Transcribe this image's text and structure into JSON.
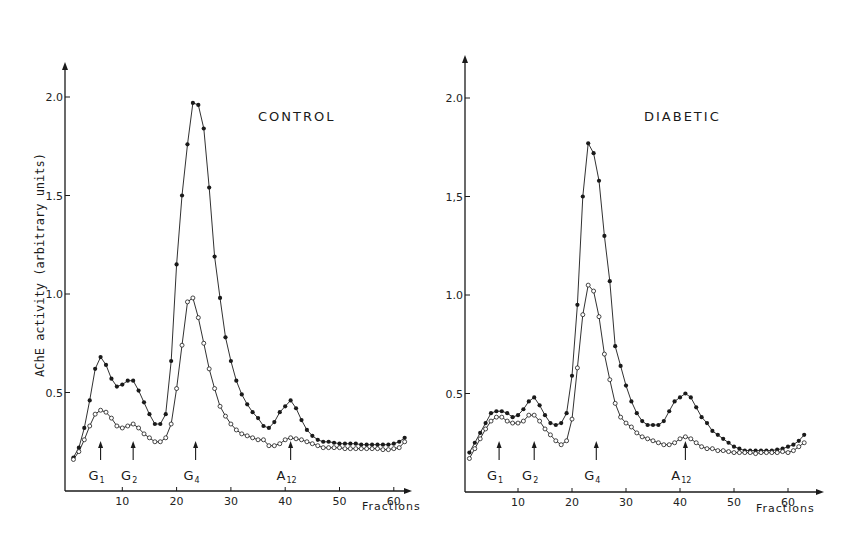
{
  "chart_data": [
    {
      "type": "line",
      "title": "CONTROL",
      "xlabel": "Fractions",
      "ylabel": "AChE activity (arbitrary units)",
      "xlim": [
        0,
        63
      ],
      "ylim": [
        0,
        2.3
      ],
      "x_ticks": [
        10,
        20,
        30,
        40,
        50,
        60
      ],
      "y_ticks": [
        {
          "value": 0.5,
          "label": "0.5"
        },
        {
          "value": 1.0,
          "label": "1.0"
        },
        {
          "value": 1.5,
          "label": "1.5"
        },
        {
          "value": 2.0,
          "label": "2.0"
        }
      ],
      "grid": false,
      "markers": [
        {
          "label": "G",
          "sub": "1",
          "x": 6
        },
        {
          "label": "G",
          "sub": "2",
          "x": 12
        },
        {
          "label": "G",
          "sub": "4",
          "x": 23.5
        },
        {
          "label": "A",
          "sub": "12",
          "x": 41
        }
      ],
      "series": [
        {
          "name": "filled-circles",
          "marker": "filled",
          "x": [
            1,
            2,
            3,
            4,
            5,
            6,
            7,
            8,
            9,
            10,
            11,
            12,
            13,
            14,
            15,
            16,
            17,
            18,
            19,
            20,
            21,
            22,
            23,
            24,
            25,
            26,
            27,
            28,
            29,
            30,
            31,
            32,
            33,
            34,
            35,
            36,
            37,
            38,
            39,
            40,
            41,
            42,
            43,
            44,
            45,
            46,
            47,
            48,
            49,
            50,
            51,
            52,
            53,
            54,
            55,
            56,
            57,
            58,
            59,
            60,
            61,
            62
          ],
          "values": [
            0.17,
            0.22,
            0.32,
            0.46,
            0.62,
            0.68,
            0.64,
            0.57,
            0.53,
            0.54,
            0.56,
            0.56,
            0.51,
            0.45,
            0.39,
            0.34,
            0.34,
            0.39,
            0.66,
            1.15,
            1.5,
            1.76,
            1.97,
            1.96,
            1.84,
            1.54,
            1.19,
            0.98,
            0.78,
            0.66,
            0.56,
            0.49,
            0.44,
            0.4,
            0.37,
            0.33,
            0.32,
            0.35,
            0.4,
            0.43,
            0.46,
            0.42,
            0.36,
            0.31,
            0.28,
            0.26,
            0.25,
            0.25,
            0.245,
            0.24,
            0.24,
            0.24,
            0.24,
            0.235,
            0.235,
            0.235,
            0.235,
            0.235,
            0.235,
            0.24,
            0.25,
            0.27
          ]
        },
        {
          "name": "open-circles",
          "marker": "open",
          "x": [
            1,
            2,
            3,
            4,
            5,
            6,
            7,
            8,
            9,
            10,
            11,
            12,
            13,
            14,
            15,
            16,
            17,
            18,
            19,
            20,
            21,
            22,
            23,
            24,
            25,
            26,
            27,
            28,
            29,
            30,
            31,
            32,
            33,
            34,
            35,
            36,
            37,
            38,
            39,
            40,
            41,
            42,
            43,
            44,
            45,
            46,
            47,
            48,
            49,
            50,
            51,
            52,
            53,
            54,
            55,
            56,
            57,
            58,
            59,
            60,
            61,
            62
          ],
          "values": [
            0.16,
            0.2,
            0.26,
            0.33,
            0.39,
            0.41,
            0.4,
            0.37,
            0.33,
            0.32,
            0.33,
            0.34,
            0.32,
            0.29,
            0.27,
            0.25,
            0.25,
            0.27,
            0.34,
            0.52,
            0.74,
            0.96,
            0.98,
            0.88,
            0.75,
            0.62,
            0.52,
            0.43,
            0.38,
            0.34,
            0.31,
            0.29,
            0.28,
            0.27,
            0.26,
            0.26,
            0.23,
            0.23,
            0.24,
            0.26,
            0.27,
            0.265,
            0.26,
            0.25,
            0.24,
            0.23,
            0.22,
            0.22,
            0.22,
            0.22,
            0.215,
            0.215,
            0.215,
            0.215,
            0.215,
            0.215,
            0.215,
            0.21,
            0.21,
            0.215,
            0.22,
            0.25
          ]
        }
      ]
    },
    {
      "type": "line",
      "title": "DIABETIC",
      "xlabel": "Fractions",
      "ylabel": "",
      "xlim": [
        0,
        64
      ],
      "ylim": [
        0,
        2.3
      ],
      "x_ticks": [
        10,
        20,
        30,
        40,
        50,
        60
      ],
      "y_ticks": [
        {
          "value": 0.5,
          "label": "0.5"
        },
        {
          "value": 1.0,
          "label": "1.0"
        },
        {
          "value": 1.5,
          "label": "1,5"
        },
        {
          "value": 2.0,
          "label": "2.0"
        }
      ],
      "grid": false,
      "markers": [
        {
          "label": "G",
          "sub": "1",
          "x": 6.5
        },
        {
          "label": "G",
          "sub": "2",
          "x": 13
        },
        {
          "label": "G",
          "sub": "4",
          "x": 24.5
        },
        {
          "label": "A",
          "sub": "12",
          "x": 41
        }
      ],
      "series": [
        {
          "name": "filled-circles",
          "marker": "filled",
          "x": [
            1,
            2,
            3,
            4,
            5,
            6,
            7,
            8,
            9,
            10,
            11,
            12,
            13,
            14,
            15,
            16,
            17,
            18,
            19,
            20,
            21,
            22,
            23,
            24,
            25,
            26,
            27,
            28,
            29,
            30,
            31,
            32,
            33,
            34,
            35,
            36,
            37,
            38,
            39,
            40,
            41,
            42,
            43,
            44,
            45,
            46,
            47,
            48,
            49,
            50,
            51,
            52,
            53,
            54,
            55,
            56,
            57,
            58,
            59,
            60,
            61,
            62,
            63
          ],
          "values": [
            0.2,
            0.25,
            0.3,
            0.35,
            0.4,
            0.41,
            0.41,
            0.4,
            0.38,
            0.39,
            0.42,
            0.46,
            0.48,
            0.44,
            0.39,
            0.35,
            0.34,
            0.35,
            0.4,
            0.59,
            0.95,
            1.5,
            1.77,
            1.72,
            1.58,
            1.3,
            1.07,
            0.74,
            0.64,
            0.54,
            0.46,
            0.4,
            0.36,
            0.34,
            0.34,
            0.34,
            0.36,
            0.41,
            0.46,
            0.48,
            0.5,
            0.48,
            0.43,
            0.38,
            0.35,
            0.31,
            0.29,
            0.27,
            0.25,
            0.23,
            0.22,
            0.21,
            0.21,
            0.21,
            0.21,
            0.21,
            0.21,
            0.215,
            0.22,
            0.23,
            0.24,
            0.26,
            0.29
          ]
        },
        {
          "name": "open-circles",
          "marker": "open",
          "x": [
            1,
            2,
            3,
            4,
            5,
            6,
            7,
            8,
            9,
            10,
            11,
            12,
            13,
            14,
            15,
            16,
            17,
            18,
            19,
            20,
            21,
            22,
            23,
            24,
            25,
            26,
            27,
            28,
            29,
            30,
            31,
            32,
            33,
            34,
            35,
            36,
            37,
            38,
            39,
            40,
            41,
            42,
            43,
            44,
            45,
            46,
            47,
            48,
            49,
            50,
            51,
            52,
            53,
            54,
            55,
            56,
            57,
            58,
            59,
            60,
            61,
            62,
            63
          ],
          "values": [
            0.17,
            0.22,
            0.27,
            0.32,
            0.36,
            0.38,
            0.38,
            0.36,
            0.35,
            0.35,
            0.36,
            0.39,
            0.39,
            0.36,
            0.32,
            0.29,
            0.26,
            0.24,
            0.26,
            0.37,
            0.63,
            0.9,
            1.05,
            1.02,
            0.89,
            0.7,
            0.57,
            0.45,
            0.38,
            0.35,
            0.33,
            0.3,
            0.28,
            0.27,
            0.26,
            0.25,
            0.24,
            0.24,
            0.25,
            0.27,
            0.28,
            0.27,
            0.25,
            0.23,
            0.22,
            0.22,
            0.21,
            0.21,
            0.205,
            0.2,
            0.2,
            0.2,
            0.2,
            0.195,
            0.2,
            0.2,
            0.2,
            0.2,
            0.205,
            0.2,
            0.21,
            0.23,
            0.25
          ]
        }
      ]
    }
  ],
  "layout": {
    "panels": [
      {
        "x0": 68,
        "px_per_x": 5.43,
        "axis_x": 65,
        "y0": 491,
        "px_per_y": 197,
        "axis_top": 62,
        "axis_right": 412,
        "title_pos": [
          258,
          121
        ],
        "ylabel_pos": [
          44,
          265
        ],
        "xlabel_pos": [
          362,
          510
        ]
      },
      {
        "x0": 464,
        "px_per_x": 5.4,
        "axis_x": 465,
        "y0": 492,
        "px_per_y": 197,
        "axis_top": 55,
        "axis_right": 824,
        "title_pos": [
          644,
          121
        ],
        "ylabel_pos": null,
        "xlabel_pos": [
          756,
          512
        ]
      }
    ],
    "ink": "#1a1a1a"
  }
}
